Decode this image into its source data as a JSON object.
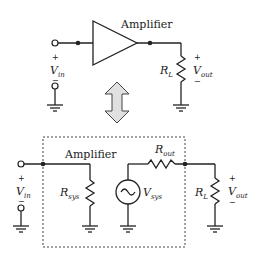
{
  "top_circuit": {
    "amplifier_label": "Amplifier",
    "input": {
      "symbol": "V",
      "subscript": "in",
      "plus": "+",
      "minus": "−"
    },
    "load": {
      "symbol": "R",
      "subscript": "L"
    },
    "output": {
      "symbol": "V",
      "subscript": "out",
      "plus": "+",
      "minus": "−"
    }
  },
  "equivalence_arrow": "double-vertical-arrow",
  "bottom_circuit": {
    "amplifier_label": "Amplifier",
    "input": {
      "symbol": "V",
      "subscript": "in",
      "plus": "+",
      "minus": "−"
    },
    "r_sys": {
      "symbol": "R",
      "subscript": "sys"
    },
    "v_sys": {
      "symbol": "V",
      "subscript": "sys"
    },
    "r_out": {
      "symbol": "R",
      "subscript": "out"
    },
    "load": {
      "symbol": "R",
      "subscript": "L"
    },
    "output": {
      "symbol": "V",
      "subscript": "out",
      "plus": "+",
      "minus": "−"
    }
  }
}
